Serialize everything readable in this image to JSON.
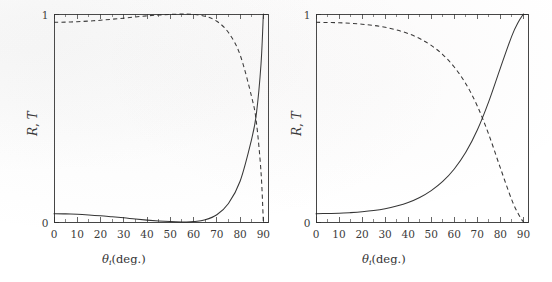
{
  "figure": {
    "background": "#ffffff",
    "ink_color": "#242424",
    "panel_count": 2
  },
  "chart_data": [
    {
      "type": "line",
      "panel": "left",
      "title": "",
      "xlabel": "θi(deg.)",
      "xlabel_symbol": "θ",
      "xlabel_subscript": "i",
      "xlabel_unit": "(deg.)",
      "ylabel": "R, T",
      "xlim": [
        0,
        92
      ],
      "ylim": [
        0,
        1
      ],
      "xticks": [
        0,
        10,
        20,
        30,
        40,
        50,
        60,
        70,
        80,
        90
      ],
      "xticklabels": [
        "0",
        "10",
        "20",
        "30",
        "40",
        "50",
        "60",
        "70",
        "80",
        "90"
      ],
      "xminor_step": 5,
      "yticks": [
        0,
        1
      ],
      "yticklabels": [
        "0",
        "1"
      ],
      "grid": false,
      "legend": null,
      "frame": "box",
      "ticks_direction": "in",
      "notes": "p-polarization: reflectance dips to zero at the Brewster angle (~56 deg)",
      "series": [
        {
          "name": "R",
          "style": "solid",
          "x": [
            0,
            5,
            10,
            15,
            20,
            25,
            30,
            35,
            40,
            45,
            50,
            55,
            56.3,
            60,
            65,
            70,
            75,
            80,
            85,
            87,
            89,
            90
          ],
          "values": [
            0.04,
            0.039,
            0.037,
            0.034,
            0.03,
            0.025,
            0.02,
            0.014,
            0.009,
            0.005,
            0.002,
            0.0,
            0.0,
            0.002,
            0.011,
            0.035,
            0.089,
            0.196,
            0.4,
            0.52,
            0.76,
            1.0
          ]
        },
        {
          "name": "T",
          "style": "dashed",
          "x": [
            0,
            5,
            10,
            15,
            20,
            25,
            30,
            35,
            40,
            45,
            50,
            55,
            56.3,
            60,
            65,
            70,
            75,
            80,
            85,
            87,
            89,
            90
          ],
          "values": [
            0.96,
            0.961,
            0.963,
            0.966,
            0.97,
            0.975,
            0.98,
            0.986,
            0.991,
            0.995,
            0.998,
            1.0,
            1.0,
            0.998,
            0.989,
            0.965,
            0.911,
            0.804,
            0.6,
            0.48,
            0.24,
            0.0
          ]
        }
      ],
      "crossing": {
        "x": 86,
        "y": 0.46
      }
    },
    {
      "type": "line",
      "panel": "right",
      "title": "",
      "xlabel": "θi(deg.)",
      "xlabel_symbol": "θ",
      "xlabel_subscript": "i",
      "xlabel_unit": "(deg.)",
      "ylabel": "R, T",
      "xlim": [
        0,
        92
      ],
      "ylim": [
        0,
        1
      ],
      "xticks": [
        0,
        10,
        20,
        30,
        40,
        50,
        60,
        70,
        80,
        90
      ],
      "xticklabels": [
        "0",
        "10",
        "20",
        "30",
        "40",
        "50",
        "60",
        "70",
        "80",
        "90"
      ],
      "xminor_step": 5,
      "yticks": [
        0,
        1
      ],
      "yticklabels": [
        "0",
        "1"
      ],
      "grid": false,
      "legend": null,
      "frame": "box",
      "ticks_direction": "in",
      "notes": "s-polarization: reflectance rises monotonically from 0.04 to 1",
      "series": [
        {
          "name": "R",
          "style": "solid",
          "x": [
            0,
            5,
            10,
            15,
            20,
            25,
            30,
            35,
            40,
            45,
            50,
            55,
            60,
            65,
            70,
            75,
            80,
            85,
            88,
            90
          ],
          "values": [
            0.04,
            0.041,
            0.042,
            0.045,
            0.049,
            0.055,
            0.064,
            0.077,
            0.094,
            0.118,
            0.151,
            0.195,
            0.255,
            0.335,
            0.442,
            0.58,
            0.74,
            0.895,
            0.965,
            1.0
          ]
        },
        {
          "name": "T",
          "style": "dashed",
          "x": [
            0,
            5,
            10,
            15,
            20,
            25,
            30,
            35,
            40,
            45,
            50,
            55,
            60,
            65,
            70,
            75,
            80,
            85,
            88,
            90
          ],
          "values": [
            0.96,
            0.959,
            0.958,
            0.955,
            0.951,
            0.945,
            0.936,
            0.923,
            0.906,
            0.882,
            0.849,
            0.805,
            0.745,
            0.665,
            0.558,
            0.42,
            0.26,
            0.105,
            0.035,
            0.0
          ]
        }
      ],
      "crossing": {
        "x": 79,
        "y": 0.47
      }
    }
  ],
  "panels": [
    {
      "id": "left-panel",
      "ylabel_text": "R, T",
      "ylabel_parts": {
        "r": "R",
        "comma": ", ",
        "t": "T"
      },
      "xlabel_parts": {
        "theta": "θ",
        "sub": "i",
        "unit": "(deg.)"
      },
      "ytick_top": "1",
      "ytick_bottom": "0",
      "xtick_labels": [
        "0",
        "10",
        "20",
        "30",
        "40",
        "50",
        "60",
        "70",
        "80",
        "90"
      ]
    },
    {
      "id": "right-panel",
      "ylabel_text": "R, T",
      "ylabel_parts": {
        "r": "R",
        "comma": ", ",
        "t": "T"
      },
      "xlabel_parts": {
        "theta": "θ",
        "sub": "i",
        "unit": "(deg.)"
      },
      "ytick_top": "1",
      "ytick_bottom": "0",
      "xtick_labels": [
        "0",
        "10",
        "20",
        "30",
        "40",
        "50",
        "60",
        "70",
        "80",
        "90"
      ]
    }
  ]
}
